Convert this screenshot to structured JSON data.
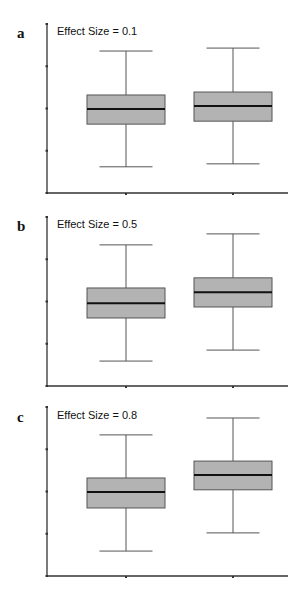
{
  "chart_data": [
    {
      "type": "box",
      "panel_label": "a",
      "title": "Effect Size = 0.1",
      "xlabel": "",
      "ylabel": "",
      "categories": [
        "Group 1",
        "Group 2"
      ],
      "tick_labels_shown": false,
      "ylim": [
        0,
        4
      ],
      "y_ticks": [
        0,
        1,
        2,
        3,
        4
      ],
      "boxes": [
        {
          "whisker_min": 0.62,
          "q1": 1.63,
          "median": 1.99,
          "q3": 2.32,
          "whisker_max": 3.36
        },
        {
          "whisker_min": 0.69,
          "q1": 1.7,
          "median": 2.06,
          "q3": 2.39,
          "whisker_max": 3.43
        }
      ]
    },
    {
      "type": "box",
      "panel_label": "b",
      "title": "Effect Size = 0.5",
      "xlabel": "",
      "ylabel": "",
      "categories": [
        "Group 1",
        "Group 2"
      ],
      "tick_labels_shown": false,
      "ylim": [
        0,
        4
      ],
      "y_ticks": [
        0,
        1,
        2,
        3,
        4
      ],
      "boxes": [
        {
          "whisker_min": 0.59,
          "q1": 1.61,
          "median": 1.96,
          "q3": 2.32,
          "whisker_max": 3.34
        },
        {
          "whisker_min": 0.85,
          "q1": 1.87,
          "median": 2.22,
          "q3": 2.56,
          "whisker_max": 3.6
        }
      ]
    },
    {
      "type": "box",
      "panel_label": "c",
      "title": "Effect Size = 0.8",
      "xlabel": "",
      "ylabel": "",
      "categories": [
        "Group 1",
        "Group 2"
      ],
      "tick_labels_shown": false,
      "ylim": [
        0,
        4
      ],
      "y_ticks": [
        0,
        1,
        2,
        3,
        4
      ],
      "boxes": [
        {
          "whisker_min": 0.59,
          "q1": 1.61,
          "median": 1.99,
          "q3": 2.32,
          "whisker_max": 3.34
        },
        {
          "whisker_min": 1.02,
          "q1": 2.04,
          "median": 2.39,
          "q3": 2.72,
          "whisker_max": 3.74
        }
      ]
    }
  ],
  "colors": {
    "box_fill": "#b3b3b3",
    "box_stroke": "#555555",
    "median": "#111111",
    "whisker": "#555555",
    "axis": "#333333"
  }
}
